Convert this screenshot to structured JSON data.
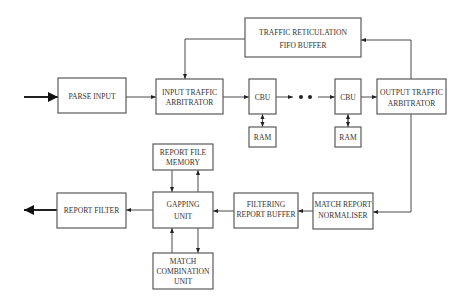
{
  "diagram": {
    "type": "block-diagram",
    "blocks": {
      "parse_input": {
        "lines": [
          "PARSE INPUT"
        ]
      },
      "input_traffic_arbitrator": {
        "lines": [
          "INPUT TRAFFIC",
          "ARBITRATOR"
        ]
      },
      "fifo_buffer": {
        "lines": [
          "TRAFFIC RETICULATION",
          "FIFO BUFFER"
        ]
      },
      "cbu_1": {
        "lines": [
          "CBU"
        ]
      },
      "ram_1": {
        "lines": [
          "RAM"
        ]
      },
      "cbu_2": {
        "lines": [
          "CBU"
        ]
      },
      "ram_2": {
        "lines": [
          "RAM"
        ]
      },
      "output_traffic_arbitrator": {
        "lines": [
          "OUTPUT TRAFFIC",
          "ARBITRATOR"
        ]
      },
      "report_file_memory": {
        "lines": [
          "REPORT FILE",
          "MEMORY"
        ]
      },
      "gapping_unit": {
        "lines": [
          "GAPPING",
          "UNIT"
        ]
      },
      "match_combination_unit": {
        "lines": [
          "MATCH",
          "COMBINATION",
          "UNIT"
        ]
      },
      "report_filter": {
        "lines": [
          "REPORT FILTER"
        ]
      },
      "filtering_report_buffer": {
        "lines": [
          "FILTERING",
          "REPORT BUFFER"
        ]
      },
      "match_report_normaliser": {
        "lines": [
          "MATCH REPORT",
          "NORMALISER"
        ]
      }
    },
    "ellipsis": "• •",
    "connections": [
      {
        "from": "input",
        "to": "PARSE INPUT"
      },
      {
        "from": "PARSE INPUT",
        "to": "INPUT TRAFFIC ARBITRATOR"
      },
      {
        "from": "INPUT TRAFFIC ARBITRATOR",
        "to": "CBU"
      },
      {
        "from": "CBU",
        "to": "CBU (chain)"
      },
      {
        "from": "CBU",
        "to": "OUTPUT TRAFFIC ARBITRATOR"
      },
      {
        "from": "CBU",
        "to": "RAM",
        "bidirectional": true
      },
      {
        "from": "OUTPUT TRAFFIC ARBITRATOR",
        "to": "TRAFFIC RETICULATION FIFO BUFFER"
      },
      {
        "from": "TRAFFIC RETICULATION FIFO BUFFER",
        "to": "INPUT TRAFFIC ARBITRATOR"
      },
      {
        "from": "OUTPUT TRAFFIC ARBITRATOR",
        "to": "MATCH REPORT NORMALISER"
      },
      {
        "from": "MATCH REPORT NORMALISER",
        "to": "FILTERING REPORT BUFFER"
      },
      {
        "from": "FILTERING REPORT BUFFER",
        "to": "GAPPING UNIT"
      },
      {
        "from": "GAPPING UNIT",
        "to": "REPORT FILE MEMORY",
        "bidirectional": true
      },
      {
        "from": "GAPPING UNIT",
        "to": "MATCH COMBINATION UNIT",
        "bidirectional": true
      },
      {
        "from": "GAPPING UNIT",
        "to": "REPORT FILTER"
      },
      {
        "from": "REPORT FILTER",
        "to": "output"
      }
    ]
  }
}
